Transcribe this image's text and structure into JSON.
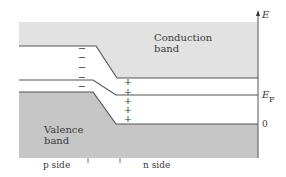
{
  "diagram": {
    "type": "pn-junction-band-diagram",
    "labels": {
      "conduction_band_line1": "Conduction",
      "conduction_band_line2": "band",
      "valence_band_line1": "Valence",
      "valence_band_line2": "band",
      "p_side": "p side",
      "n_side": "n side",
      "energy_axis": "E",
      "fermi_level_main": "E",
      "fermi_level_sub": "F",
      "zero": "0"
    },
    "charges": {
      "p_side_symbol": "−",
      "n_side_symbol": "+",
      "p_side_count": 5,
      "n_side_count": 5
    },
    "colors": {
      "conduction_fill": "#e2e2e2",
      "valence_fill": "#c6c6c6",
      "line": "#555555",
      "text": "#3a3a3a",
      "background": "#ffffff"
    }
  }
}
